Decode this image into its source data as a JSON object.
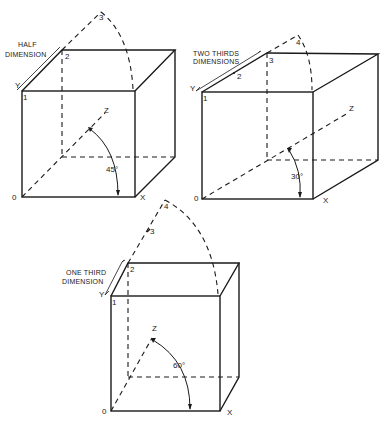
{
  "diagram": {
    "type": "oblique-projection-cubes",
    "line_color": "#1a1a1a",
    "background": "#ffffff",
    "cubes": [
      {
        "id": "half",
        "caption_lines": [
          "HALF",
          "DIMENSION"
        ],
        "angle_label": "45°",
        "axis_labels": {
          "origin": "0",
          "x": "X",
          "y": "Y",
          "z": "Z"
        },
        "point_labels": [
          "1",
          "2",
          "3"
        ]
      },
      {
        "id": "two-thirds",
        "caption_lines": [
          "TWO THIRDS",
          "DIMENSIONS"
        ],
        "angle_label": "30°",
        "axis_labels": {
          "origin": "0",
          "x": "X",
          "y": "Y",
          "z": "Z"
        },
        "point_labels": [
          "1",
          "2",
          "3",
          "4"
        ]
      },
      {
        "id": "one-third",
        "caption_lines": [
          "ONE THIRD",
          "DIMENSION"
        ],
        "angle_label": "60°",
        "axis_labels": {
          "origin": "0",
          "x": "X",
          "y": "Y",
          "z": "Z"
        },
        "point_labels": [
          "1",
          "2",
          "3",
          "4"
        ]
      }
    ]
  }
}
